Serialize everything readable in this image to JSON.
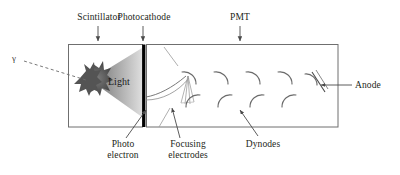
{
  "figure": {
    "type": "scientific-diagram"
  },
  "labels": {
    "scintillator": "Scintillator",
    "photocathode": "Photocathode",
    "pmt": "PMT",
    "anode": "Anode",
    "dynodes": "Dynodes",
    "photo_electron_line1": "Photo",
    "photo_electron_line2": "electron",
    "focusing_line1": "Focusing",
    "focusing_line2": "electrodes",
    "light": "Light",
    "gamma": "γ"
  },
  "colors": {
    "ink": "#231f20",
    "outline": "#6f6f6f",
    "photocathode_bar": "#000000",
    "light_cone_near": "#6e6e6e",
    "light_cone_far": "#d8d8d8",
    "burst_dark": "#4a4a4a",
    "burst_core": "#6b6b6b",
    "background": "#ffffff"
  },
  "components": {
    "dynode_count": 9,
    "top_arrow_labels": [
      "Scintillator",
      "Photocathode",
      "PMT"
    ],
    "bottom_leader_labels": [
      "Photo electron",
      "Focusing electrodes",
      "Dynodes"
    ],
    "right_leader_labels": [
      "Anode"
    ],
    "left_leader_labels": [
      "γ"
    ]
  }
}
